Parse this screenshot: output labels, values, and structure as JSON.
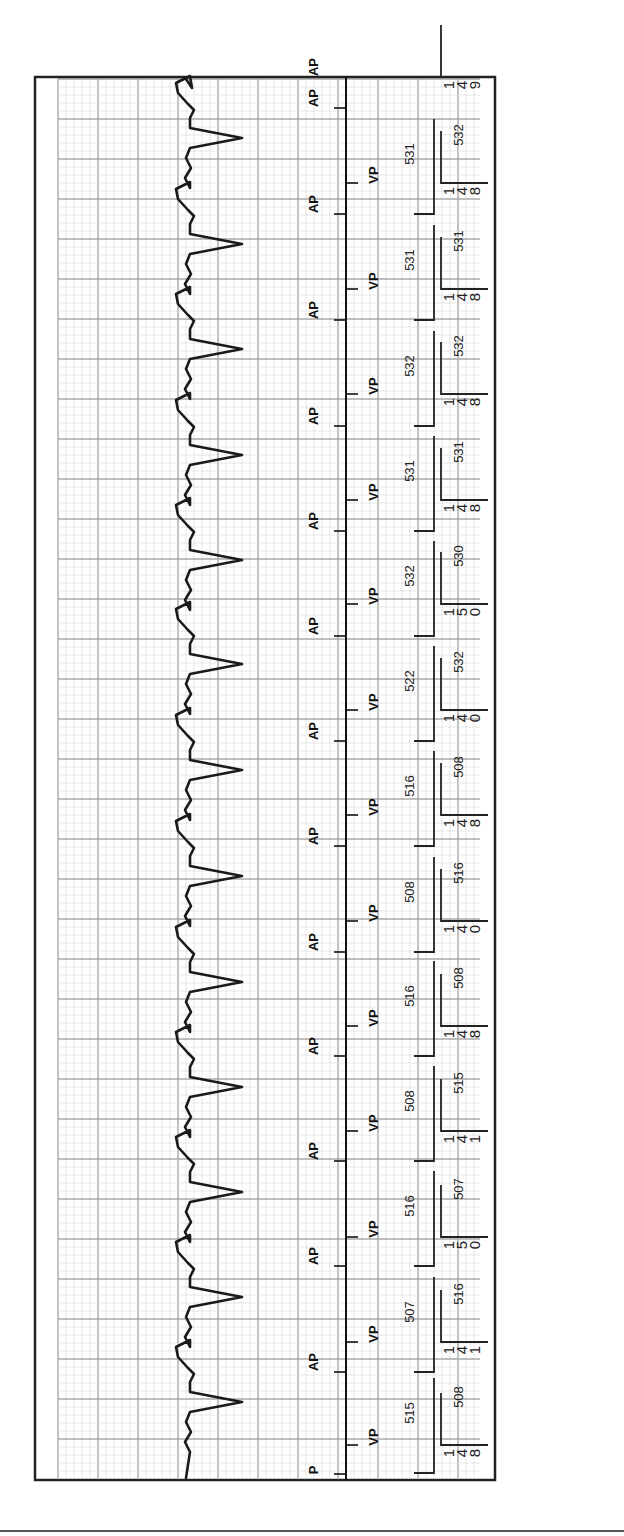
{
  "strip": {
    "orientation": "rotated-90ccw",
    "grid_color_minor": "#d6d6d6",
    "grid_color_major": "#a8a8a8",
    "trace_color": "#1a1a1a",
    "border_color": "#222222",
    "start_marker_label": "P",
    "atrial_label": "AP",
    "ventricular_label": "VP"
  },
  "chart_data": {
    "type": "line",
    "xlabel": "time (strip runs bottom to top)",
    "ylabel": "amplitude",
    "grid": true,
    "beats": 14,
    "markers": [
      "P",
      "VP",
      "AP",
      "VP",
      "AP",
      "VP",
      "AP",
      "VP",
      "AP",
      "VP",
      "AP",
      "VP",
      "AP",
      "VP",
      "AP",
      "VP",
      "AP",
      "VP",
      "AP",
      "VP",
      "AP",
      "VP",
      "AP",
      "VP",
      "AP",
      "VP",
      "AP",
      "VP"
    ],
    "av_intervals_ms": [
      148,
      141,
      150,
      141,
      148,
      140,
      148,
      140,
      150,
      148,
      148,
      148,
      148,
      149
    ],
    "vv_intervals_ms": [
      515,
      507,
      516,
      508,
      516,
      508,
      516,
      522,
      532,
      531,
      532,
      531,
      531
    ],
    "aa_intervals_ms": [
      508,
      516,
      507,
      515,
      508,
      516,
      508,
      532,
      530,
      531,
      532,
      531,
      532
    ],
    "series": [
      {
        "name": "AV interval (ms)",
        "values": [
          148,
          141,
          150,
          141,
          148,
          140,
          148,
          140,
          150,
          148,
          148,
          148,
          148,
          149
        ]
      },
      {
        "name": "V-V interval (ms)",
        "values": [
          515,
          507,
          516,
          508,
          516,
          508,
          516,
          522,
          532,
          531,
          532,
          531,
          531
        ]
      },
      {
        "name": "A-A interval (ms)",
        "values": [
          508,
          516,
          507,
          515,
          508,
          516,
          508,
          532,
          530,
          531,
          532,
          531,
          532
        ]
      }
    ]
  }
}
